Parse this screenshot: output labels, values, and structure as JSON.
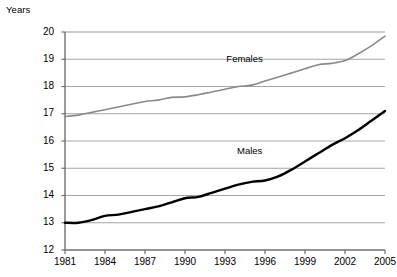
{
  "chart_data": {
    "type": "line",
    "title": "",
    "ylabel": "Years",
    "xlabel": "",
    "ylim": [
      12,
      20
    ],
    "xlim": [
      1981,
      2005
    ],
    "grid": true,
    "legend_position": "inline-annotation",
    "yticks": [
      "20",
      "19",
      "18",
      "17",
      "16",
      "15",
      "14",
      "13",
      "12"
    ],
    "ytick_values": [
      20,
      19,
      18,
      17,
      16,
      15,
      14,
      13,
      12
    ],
    "xticks": [
      "1981",
      "1984",
      "1987",
      "1990",
      "1993",
      "1996",
      "1999",
      "2002",
      "2005"
    ],
    "xtick_values": [
      1981,
      1984,
      1987,
      1990,
      1993,
      1996,
      1999,
      2002,
      2005
    ],
    "x": [
      1981,
      1982,
      1983,
      1984,
      1985,
      1986,
      1987,
      1988,
      1989,
      1990,
      1991,
      1992,
      1993,
      1994,
      1995,
      1996,
      1997,
      1998,
      1999,
      2000,
      2001,
      2002,
      2003,
      2004,
      2005
    ],
    "series": [
      {
        "name": "Females",
        "color": "#8a8a8a",
        "width": 1.6,
        "values": [
          16.9,
          16.95,
          17.05,
          17.15,
          17.25,
          17.35,
          17.45,
          17.5,
          17.6,
          17.62,
          17.7,
          17.8,
          17.9,
          18.0,
          18.05,
          18.2,
          18.35,
          18.5,
          18.65,
          18.8,
          18.85,
          18.95,
          19.2,
          19.5,
          19.85
        ]
      },
      {
        "name": "Males",
        "color": "#000000",
        "width": 2.4,
        "values": [
          13.0,
          13.0,
          13.1,
          13.25,
          13.3,
          13.4,
          13.5,
          13.6,
          13.75,
          13.9,
          13.95,
          14.1,
          14.25,
          14.4,
          14.5,
          14.55,
          14.7,
          14.95,
          15.25,
          15.55,
          15.85,
          16.1,
          16.4,
          16.75,
          17.1
        ]
      }
    ],
    "annotations": [
      {
        "text": "Females",
        "x": 1994.6,
        "y": 18.65
      },
      {
        "text": "Males",
        "x": 1995.4,
        "y": 15.25
      }
    ]
  },
  "caption": {
    "text": ""
  }
}
